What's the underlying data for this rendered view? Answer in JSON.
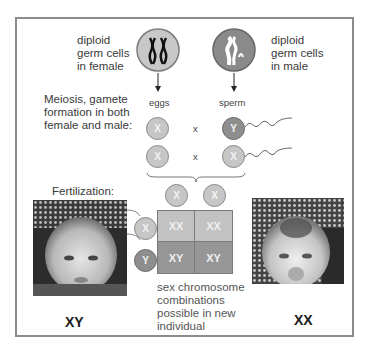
{
  "labels": {
    "female_germ": [
      "diploid",
      "germ cells",
      "in female"
    ],
    "male_germ": [
      "diploid",
      "germ cells",
      "in male"
    ],
    "meiosis": [
      "Meiosis, gamete",
      "formation in both",
      "female and male:"
    ],
    "eggs": "eggs",
    "sperm": "sperm",
    "cross": "x",
    "fertilization": "Fertilization:",
    "combinations": [
      "sex chromosome",
      "combinations",
      "possible in new",
      "individual"
    ],
    "left_baby": "XY",
    "right_baby": "XX"
  },
  "gametes": {
    "row1": {
      "egg": "X",
      "sperm": "Y"
    },
    "row2": {
      "egg": "X",
      "sperm": "X"
    }
  },
  "punnett": {
    "top": [
      "X",
      "X"
    ],
    "side": [
      "X",
      "Y"
    ],
    "cells": [
      [
        "XX",
        "XX"
      ],
      [
        "XY",
        "XY"
      ]
    ]
  },
  "colors": {
    "x_chromosome": "#c6c6c6",
    "y_chromosome": "#8e8e8e",
    "frame": "#8c8c8c"
  }
}
